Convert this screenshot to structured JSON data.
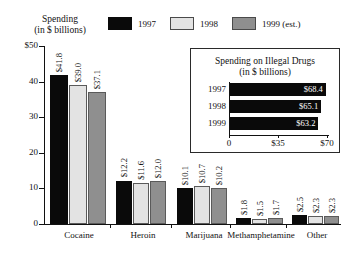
{
  "header": {
    "title_line1": "Spending",
    "title_line2": "(in $ billions)"
  },
  "legend": {
    "items": [
      {
        "label": "1997",
        "color": "#0a0a0a",
        "key": "swatch-1997"
      },
      {
        "label": "1998",
        "color": "#e3e3e3",
        "key": "swatch-1998"
      },
      {
        "label": "1999 (est.)",
        "color": "#8f8f8f",
        "key": "swatch-1999"
      }
    ]
  },
  "inset": {
    "title_line1": "Spending on Illegal Drugs",
    "title_line2": "(in $ billions)",
    "rows": [
      {
        "year": "1997",
        "label": "$68.4",
        "value": 68.4
      },
      {
        "year": "1998",
        "label": "$65.1",
        "value": 65.1
      },
      {
        "year": "1999",
        "label": "$63.2",
        "value": 63.2
      }
    ],
    "xticks": [
      "0",
      "$35",
      "$70"
    ]
  },
  "chart_data": {
    "type": "bar",
    "title": "Spending (in $ billions)",
    "xlabel": "",
    "ylabel": "Spending (in $ billions)",
    "ylim": [
      0,
      50
    ],
    "yticks": [
      "$50",
      "40",
      "30",
      "20",
      "10",
      "0"
    ],
    "ytick_values": [
      50,
      40,
      30,
      20,
      10,
      0
    ],
    "grid": false,
    "legend_position": "top",
    "categories": [
      "Cocaine",
      "Heroin",
      "Marijuana",
      "Methamphetamine",
      "Other"
    ],
    "series": [
      {
        "name": "1997",
        "color": "#0a0a0a",
        "values": [
          41.8,
          12.2,
          10.1,
          1.8,
          2.5
        ],
        "labels": [
          "$41.8",
          "$12.2",
          "$10.1",
          "$1.8",
          "$2.5"
        ]
      },
      {
        "name": "1998",
        "color": "#e3e3e3",
        "values": [
          39.0,
          11.6,
          10.7,
          1.5,
          2.3
        ],
        "labels": [
          "$39.0",
          "$11.6",
          "$10.7",
          "$1.5",
          "$2.3"
        ]
      },
      {
        "name": "1999 (est.)",
        "color": "#8f8f8f",
        "values": [
          37.1,
          12.0,
          10.2,
          1.7,
          2.3
        ],
        "labels": [
          "$37.1",
          "$12.0",
          "$10.2",
          "$1.7",
          "$2.3"
        ]
      }
    ],
    "inset_chart": {
      "type": "bar",
      "orientation": "horizontal",
      "title": "Spending on Illegal Drugs (in $ billions)",
      "categories": [
        "1997",
        "1998",
        "1999"
      ],
      "values": [
        68.4,
        65.1,
        63.2
      ],
      "labels": [
        "$68.4",
        "$65.1",
        "$63.2"
      ],
      "xlim": [
        0,
        70
      ],
      "xticks": [
        "0",
        "$35",
        "$70"
      ]
    }
  }
}
